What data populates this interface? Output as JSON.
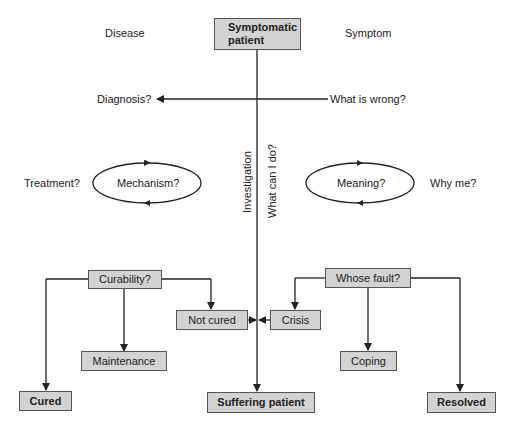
{
  "header_labels": {
    "left": "Disease",
    "right": "Symptom"
  },
  "nodes": {
    "start": "Symptomatic patient",
    "curability": "Curability?",
    "not_cured": "Not cured",
    "maintenance": "Maintenance",
    "cured": "Cured",
    "suffering": "Suffering patient",
    "crisis": "Crisis",
    "whose_fault": "Whose fault?",
    "coping": "Coping",
    "resolved": "Resolved"
  },
  "questions": {
    "diagnosis": "Diagnosis?",
    "what_wrong": "What is wrong?",
    "treatment": "Treatment?",
    "mechanism": "Mechanism?",
    "meaning": "Meaning?",
    "why_me": "Why me?"
  },
  "axis_labels": {
    "investigation": "Investigation",
    "what_can_i_do": "What can I do?"
  },
  "colors": {
    "box_fill": "#d3d3d3",
    "line": "#222222"
  }
}
